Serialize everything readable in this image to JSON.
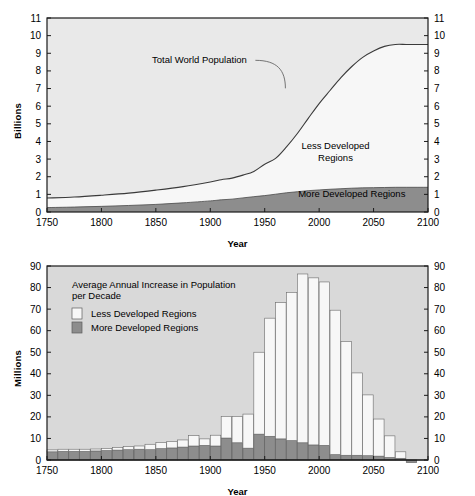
{
  "figure": {
    "background": "#ffffff",
    "colors": {
      "plot_bg_top": "#e9e9e9",
      "plot_bg_bottom": "#d9d9d9",
      "less_developed": "#f7f7f7",
      "more_developed": "#8d8d8d",
      "axis": "#1a1a1a",
      "curve": "#3a3a3a"
    }
  },
  "chart_data": [
    {
      "type": "area",
      "id": "world-population-stacked-area",
      "title": "",
      "xlabel": "Year",
      "ylabel": "Billions",
      "xlim": [
        1750,
        2100
      ],
      "ylim": [
        0,
        11
      ],
      "xticks": [
        1750,
        1800,
        1850,
        1900,
        1950,
        2000,
        2050,
        2100
      ],
      "yticks": [
        0,
        1,
        2,
        3,
        4,
        5,
        6,
        7,
        8,
        9,
        10,
        11
      ],
      "grid": false,
      "legend_position": "inline-annotations",
      "annotations": [
        {
          "text": "Total World Population",
          "x": 1890,
          "y": 8.6
        },
        {
          "text": "Less Developed",
          "x": 2015,
          "y": 3.6
        },
        {
          "text": "Regions",
          "x": 2015,
          "y": 2.9
        },
        {
          "text": "More  Developed Regions",
          "x": 2030,
          "y": 0.85
        }
      ],
      "x": [
        1750,
        1775,
        1800,
        1825,
        1850,
        1875,
        1900,
        1910,
        1920,
        1930,
        1940,
        1950,
        1960,
        1970,
        1980,
        1990,
        2000,
        2010,
        2020,
        2030,
        2040,
        2050,
        2060,
        2070,
        2080,
        2090,
        2100
      ],
      "series": [
        {
          "name": "More Developed Regions",
          "fill": "#8d8d8d",
          "values": [
            0.25,
            0.28,
            0.32,
            0.37,
            0.43,
            0.52,
            0.63,
            0.69,
            0.73,
            0.8,
            0.87,
            0.93,
            1.01,
            1.09,
            1.15,
            1.21,
            1.25,
            1.29,
            1.32,
            1.35,
            1.37,
            1.38,
            1.39,
            1.4,
            1.4,
            1.4,
            1.4
          ]
        },
        {
          "name": "Less Developed Regions",
          "fill": "#f7f7f7",
          "values": [
            0.54,
            0.57,
            0.63,
            0.7,
            0.81,
            0.92,
            1.07,
            1.14,
            1.19,
            1.29,
            1.43,
            1.78,
            2.03,
            2.6,
            3.3,
            4.1,
            4.9,
            5.6,
            6.3,
            6.9,
            7.4,
            7.75,
            8.0,
            8.1,
            8.1,
            8.1,
            8.1
          ]
        }
      ],
      "total_curve": {
        "name": "Total World Population",
        "values": [
          0.79,
          0.85,
          0.95,
          1.07,
          1.24,
          1.44,
          1.7,
          1.83,
          1.92,
          2.09,
          2.3,
          2.71,
          3.04,
          3.69,
          4.45,
          5.31,
          6.15,
          6.89,
          7.62,
          8.25,
          8.77,
          9.13,
          9.39,
          9.5,
          9.5,
          9.5,
          9.5
        ]
      }
    },
    {
      "type": "bar",
      "id": "average-annual-increase-bar",
      "title": "Average Annual Increase in Population per Decade",
      "title_line1": "Average Annual Increase in Population",
      "title_line2": "per Decade",
      "xlabel": "Year",
      "ylabel": "Millions",
      "xlim": [
        1750,
        2100
      ],
      "ylim": [
        0,
        90
      ],
      "xticks": [
        1750,
        1800,
        1850,
        1900,
        1950,
        2000,
        2050,
        2100
      ],
      "yticks": [
        0,
        10,
        20,
        30,
        40,
        50,
        60,
        70,
        80,
        90
      ],
      "grid": false,
      "legend_position": "upper-left-inset",
      "legend": [
        {
          "label": "Less Developed Regions",
          "fill": "#f7f7f7"
        },
        {
          "label": "More Developed Regions",
          "fill": "#8d8d8d"
        }
      ],
      "stacked": true,
      "bar_decade_start": [
        1750,
        1760,
        1770,
        1780,
        1790,
        1800,
        1810,
        1820,
        1830,
        1840,
        1850,
        1860,
        1870,
        1880,
        1890,
        1900,
        1910,
        1920,
        1930,
        1940,
        1950,
        1960,
        1970,
        1980,
        1990,
        2000,
        2010,
        2020,
        2030,
        2040,
        2050,
        2060,
        2070,
        2080
      ],
      "categories": [
        "1750s",
        "1760s",
        "1770s",
        "1780s",
        "1790s",
        "1800s",
        "1810s",
        "1820s",
        "1830s",
        "1840s",
        "1850s",
        "1860s",
        "1870s",
        "1880s",
        "1890s",
        "1900s",
        "1910s",
        "1920s",
        "1930s",
        "1940s",
        "1950s",
        "1960s",
        "1970s",
        "1980s",
        "1990s",
        "2000s",
        "2010s",
        "2020s",
        "2030s",
        "2040s",
        "2050s",
        "2060s",
        "2070s",
        "2080s"
      ],
      "series": [
        {
          "name": "More Developed Regions",
          "fill": "#8d8d8d",
          "values": [
            3.8,
            4.0,
            4.0,
            4.0,
            4.2,
            4.4,
            4.6,
            4.8,
            5.0,
            4.8,
            5.3,
            5.6,
            6.0,
            6.5,
            6.8,
            6.5,
            10.2,
            8.0,
            5.5,
            12.0,
            11.0,
            9.8,
            9.0,
            8.0,
            7.0,
            6.8,
            2.5,
            2.2,
            2.2,
            2.0,
            1.8,
            1.2,
            0.8,
            -1.2
          ]
        },
        {
          "name": "Less Developed Regions",
          "fill": "#f7f7f7",
          "values": [
            0.9,
            1.0,
            1.0,
            1.0,
            0.9,
            1.0,
            1.2,
            1.4,
            1.5,
            2.5,
            2.8,
            3.0,
            3.3,
            4.8,
            3.0,
            5.0,
            10.0,
            12.2,
            15.8,
            38.0,
            54.8,
            63.2,
            68.8,
            78.3,
            77.5,
            75.8,
            67.0,
            52.8,
            38.2,
            28.2,
            17.2,
            10.0,
            3.0,
            0.0
          ]
        }
      ],
      "totals": [
        4.7,
        5.0,
        5.0,
        5.0,
        5.1,
        5.4,
        5.8,
        6.2,
        6.5,
        7.3,
        8.1,
        8.6,
        9.3,
        11.3,
        9.8,
        11.5,
        20.2,
        20.2,
        21.3,
        50.0,
        65.8,
        73.0,
        77.8,
        86.3,
        84.5,
        82.6,
        69.5,
        55.0,
        40.4,
        30.2,
        19.0,
        11.2,
        3.8,
        -1.2
      ]
    }
  ]
}
